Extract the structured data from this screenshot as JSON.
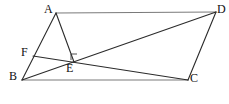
{
  "figure": {
    "type": "geometry-diagram",
    "canvas": {
      "width": 229,
      "height": 104
    },
    "background_color": "#ffffff",
    "stroke_color": "#2b2b2b",
    "light_stroke_color": "#7a7a7a",
    "points": [
      {
        "id": "A",
        "label": "A",
        "x": 56,
        "y": 13,
        "label_x": 44,
        "label_y": 3
      },
      {
        "id": "D",
        "label": "D",
        "x": 216,
        "y": 12,
        "label_x": 217,
        "label_y": 3
      },
      {
        "id": "B",
        "label": "B",
        "x": 22,
        "y": 80,
        "label_x": 9,
        "label_y": 70
      },
      {
        "id": "C",
        "label": "C",
        "x": 188,
        "y": 80,
        "label_x": 190,
        "label_y": 72
      },
      {
        "id": "E",
        "label": "E",
        "x": 74,
        "y": 62,
        "label_x": 66,
        "label_y": 62
      },
      {
        "id": "F",
        "label": "F",
        "x": 33,
        "y": 56,
        "label_x": 21,
        "label_y": 46
      }
    ],
    "segments": [
      {
        "name": "segment-AD",
        "from": "A",
        "to": "D",
        "style": "light"
      },
      {
        "name": "segment-BC",
        "from": "B",
        "to": "C",
        "style": "light"
      },
      {
        "name": "segment-AB",
        "from": "A",
        "to": "B",
        "style": "normal"
      },
      {
        "name": "segment-DC",
        "from": "D",
        "to": "C",
        "style": "normal"
      },
      {
        "name": "segment-AE",
        "from": "A",
        "to": "E",
        "style": "normal"
      },
      {
        "name": "segment-BD",
        "from": "B",
        "to": "D",
        "style": "normal"
      },
      {
        "name": "segment-FC",
        "from": "F",
        "to": "C",
        "style": "normal"
      }
    ],
    "right_angle": {
      "name": "right-angle-at-E",
      "at": "E",
      "size": 6
    }
  }
}
